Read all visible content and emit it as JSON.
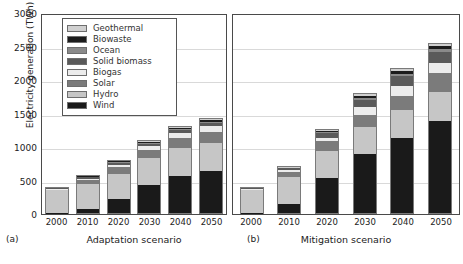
{
  "chart_data": {
    "type": "bar",
    "title": "",
    "xlabel": "",
    "ylabel": "Electricity generation (TWh)",
    "ylim": [
      0,
      3000
    ],
    "yticks": [
      0,
      500,
      1000,
      1500,
      2000,
      2500,
      3000
    ],
    "grid": true,
    "legend_position": "upper-left",
    "stacked": true,
    "categories": [
      "2000",
      "2010",
      "2020",
      "2030",
      "2040",
      "2050"
    ],
    "series_order_bottom_to_top": [
      "Wind",
      "Hydro",
      "Solar",
      "Biogas",
      "Solid biomass",
      "Ocean",
      "Biowaste",
      "Geothermal"
    ],
    "panels": [
      {
        "key": "a",
        "tag": "(a)",
        "name": "Adaptation scenario",
        "categories": [
          "2000",
          "2010",
          "2020",
          "2030",
          "2040",
          "2050"
        ],
        "series": [
          {
            "name": "Wind",
            "values": [
              5,
              70,
              210,
              430,
              570,
              640
            ]
          },
          {
            "name": "Hydro",
            "values": [
              370,
              390,
              400,
              410,
              420,
              430
            ]
          },
          {
            "name": "Solar",
            "values": [
              2,
              60,
              100,
              130,
              150,
              160
            ]
          },
          {
            "name": "Biogas",
            "values": [
              4,
              20,
              40,
              60,
              80,
              90
            ]
          },
          {
            "name": "Solid biomass",
            "values": [
              20,
              25,
              30,
              35,
              40,
              45
            ]
          },
          {
            "name": "Ocean",
            "values": [
              0,
              5,
              10,
              15,
              20,
              25
            ]
          },
          {
            "name": "Biowaste",
            "values": [
              4,
              8,
              12,
              16,
              20,
              24
            ]
          },
          {
            "name": "Geothermal",
            "values": [
              5,
              7,
              10,
              12,
              15,
              16
            ]
          }
        ],
        "totals": [
          410,
          585,
          812,
          1108,
          1315,
          1430
        ]
      },
      {
        "key": "b",
        "tag": "(b)",
        "name": "Mitigation scenario",
        "categories": [
          "2000",
          "2010",
          "2020",
          "2030",
          "2040",
          "2050"
        ],
        "series": [
          {
            "name": "Wind",
            "values": [
              5,
              135,
              530,
              890,
              1130,
              1390
            ]
          },
          {
            "name": "Hydro",
            "values": [
              370,
              420,
              420,
              420,
              430,
              440
            ]
          },
          {
            "name": "Solar",
            "values": [
              2,
              90,
              150,
              180,
              210,
              280
            ]
          },
          {
            "name": "Biogas",
            "values": [
              4,
              20,
              50,
              120,
              150,
              160
            ]
          },
          {
            "name": "Solid biomass",
            "values": [
              20,
              30,
              70,
              110,
              150,
              160
            ]
          },
          {
            "name": "Ocean",
            "values": [
              0,
              5,
              20,
              30,
              40,
              45
            ]
          },
          {
            "name": "Biowaste",
            "values": [
              4,
              8,
              20,
              30,
              40,
              45
            ]
          },
          {
            "name": "Geothermal",
            "values": [
              5,
              7,
              15,
              20,
              25,
              30
            ]
          }
        ],
        "totals": [
          410,
          715,
          1275,
          1800,
          2175,
          2550
        ]
      }
    ],
    "legend": [
      {
        "label": "Geothermal",
        "color": "#d0d0d0"
      },
      {
        "label": "Biowaste",
        "color": "#1c1c1c"
      },
      {
        "label": "Ocean",
        "color": "#8a8a8a"
      },
      {
        "label": "Solid biomass",
        "color": "#5a5a5a"
      },
      {
        "label": "Biogas",
        "color": "#ececec"
      },
      {
        "label": "Solar",
        "color": "#7b7b7b"
      },
      {
        "label": "Hydro",
        "color": "#c6c6c6"
      },
      {
        "label": "Wind",
        "color": "#1a1a1a"
      }
    ]
  }
}
